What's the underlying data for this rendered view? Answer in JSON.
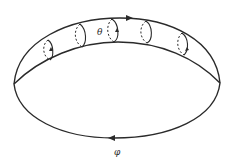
{
  "figure": {
    "labels": {
      "theta": "θ",
      "phi": "φ"
    },
    "colors": {
      "line": "#2a2a2a",
      "background": "#ffffff"
    }
  }
}
